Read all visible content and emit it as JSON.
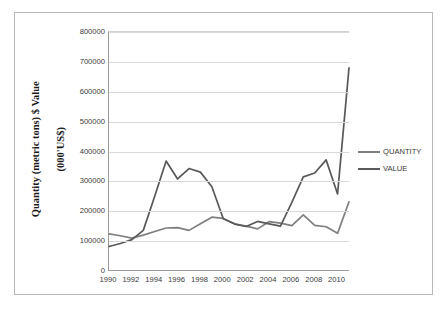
{
  "chart_data": {
    "type": "line",
    "title": "",
    "xlabel": "",
    "ylabel": "Quantity  (metric tons) $ Value (000'US$)",
    "ylabel_lines": [
      "Quantity  (metric tons) $ Value",
      "(000'US$)"
    ],
    "ylim": [
      0,
      800000
    ],
    "ytick_labels": [
      "800000",
      "700000",
      "600000",
      "500000",
      "400000",
      "300000",
      "200000",
      "100000",
      "0"
    ],
    "ytick_values": [
      800000,
      700000,
      600000,
      500000,
      400000,
      300000,
      200000,
      100000,
      0
    ],
    "xlim": [
      1990,
      2011
    ],
    "xtick_labels": [
      "1990",
      "1992",
      "1994",
      "1996",
      "1998",
      "2000",
      "2002",
      "2004",
      "2006",
      "2008",
      "2010"
    ],
    "xtick_values": [
      1990,
      1992,
      1994,
      1996,
      1998,
      2000,
      2002,
      2004,
      2006,
      2008,
      2010
    ],
    "x": [
      1990,
      1991,
      1992,
      1993,
      1994,
      1995,
      1996,
      1997,
      1998,
      1999,
      2000,
      2001,
      2002,
      2003,
      2004,
      2005,
      2006,
      2007,
      2008,
      2009,
      2010,
      2011
    ],
    "grid": true,
    "legend_position": "right",
    "series": [
      {
        "name": "QUANTITY",
        "color": "#7f7f7f",
        "values": [
          124000,
          118000,
          110000,
          120000,
          132000,
          144000,
          145000,
          136000,
          158000,
          180000,
          176000,
          158000,
          150000,
          141000,
          165000,
          160000,
          152000,
          188000,
          153000,
          148000,
          126000,
          232000
        ]
      },
      {
        "name": "VALUE",
        "color": "#595959",
        "values": [
          82000,
          92000,
          105000,
          136000,
          250000,
          368000,
          308000,
          343000,
          331000,
          282000,
          175000,
          157000,
          149000,
          166000,
          158000,
          150000,
          230000,
          315000,
          328000,
          372000,
          258000,
          680000
        ]
      }
    ]
  },
  "legend": {
    "items": [
      {
        "label": "QUANTITY",
        "color": "#7f7f7f"
      },
      {
        "label": "VALUE",
        "color": "#595959"
      }
    ]
  }
}
